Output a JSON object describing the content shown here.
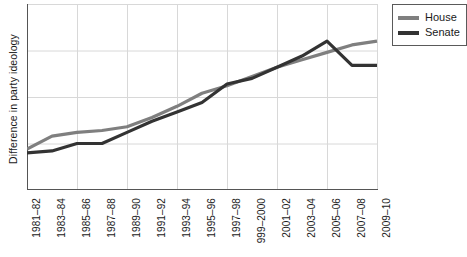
{
  "chart_data": {
    "type": "line",
    "title": "",
    "xlabel": "",
    "ylabel": "Difference in party ideology",
    "grid": true,
    "legend_position": "top-right",
    "categories": [
      "1981–82",
      "1983–84",
      "1985–86",
      "1987–88",
      "1989–90",
      "1991–92",
      "1993–94",
      "1995–96",
      "1997–98",
      "999–2000",
      "2001–02",
      "2003–04",
      "2005–06",
      "2007–08",
      "2009–10"
    ],
    "ylim": [
      0,
      1
    ],
    "yticks": [
      0.25,
      0.5,
      0.75,
      1.0
    ],
    "ytick_labels": [
      "",
      "",
      "",
      ""
    ],
    "series": [
      {
        "name": "House",
        "color": "#7f7f7f",
        "values": [
          0.22,
          0.29,
          0.31,
          0.32,
          0.34,
          0.39,
          0.45,
          0.52,
          0.56,
          0.61,
          0.66,
          0.7,
          0.74,
          0.78,
          0.8
        ]
      },
      {
        "name": "Senate",
        "color": "#333333",
        "values": [
          0.2,
          0.21,
          0.25,
          0.25,
          0.31,
          0.37,
          0.42,
          0.47,
          0.57,
          0.6,
          0.66,
          0.72,
          0.8,
          0.67,
          0.67
        ]
      }
    ]
  },
  "legend": {
    "items": [
      {
        "label": "House"
      },
      {
        "label": "Senate"
      }
    ]
  }
}
